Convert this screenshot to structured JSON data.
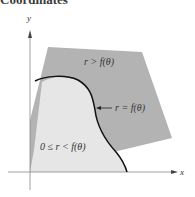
{
  "heading": "Coordinates",
  "diagram": {
    "axes": {
      "x_label": "x",
      "y_label": "y"
    },
    "regions": [
      {
        "name": "outer",
        "label": "r > f(θ)",
        "color": "#b3b3b3"
      },
      {
        "name": "inner",
        "label": "0 ≤ r < f(θ)",
        "color": "#e6e6e6"
      }
    ],
    "curve": {
      "label": "r = f(θ)",
      "color": "#111111"
    }
  }
}
